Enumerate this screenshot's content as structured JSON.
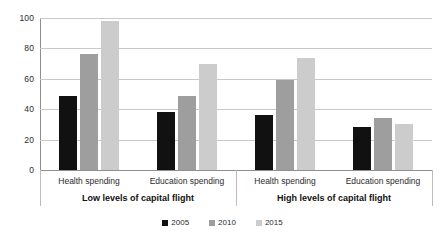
{
  "chart_data": {
    "type": "bar",
    "title": "",
    "subtitle": "",
    "xlabel": "",
    "ylabel": "",
    "ylim": [
      0,
      100
    ],
    "yticks": [
      0,
      20,
      40,
      60,
      80,
      100
    ],
    "grid": true,
    "legend_position": "bottom-center",
    "categories": [
      "Health spending",
      "Education spending",
      "Health spending",
      "Education spending"
    ],
    "group_labels": [
      "Low levels of capital flight",
      "High levels of capital flight"
    ],
    "series": [
      {
        "name": "2005",
        "color": "#111111",
        "values": [
          49,
          38,
          36,
          28
        ]
      },
      {
        "name": "2010",
        "color": "#9e9e9e",
        "values": [
          76,
          49,
          59,
          34
        ]
      },
      {
        "name": "2015",
        "color": "#cccccc",
        "values": [
          98,
          70,
          74,
          30
        ]
      }
    ]
  },
  "axis": {
    "y_tick_labels": [
      "100",
      "80",
      "60",
      "40",
      "20",
      "0"
    ]
  },
  "legend": {
    "items": [
      {
        "label": "2005",
        "color": "#111111"
      },
      {
        "label": "2010",
        "color": "#9e9e9e"
      },
      {
        "label": "2015",
        "color": "#cccccc"
      }
    ]
  },
  "colors": {
    "background": "#ffffff",
    "gridline": "#c9c9c9",
    "axis": "#8f8f8f",
    "text": "#2b2b2b",
    "series_2005": "#111111",
    "series_2010": "#9e9e9e",
    "series_2015": "#cccccc"
  }
}
